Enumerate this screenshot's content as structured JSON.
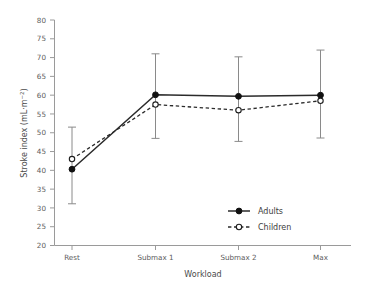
{
  "chart_data": {
    "type": "line",
    "title": "",
    "xlabel": "Workload",
    "ylabel": "Stroke index (mL·m⁻²)",
    "ylabel_parts": {
      "main": "Stroke index (mL·m",
      "superscript": "−2",
      "tail": ")"
    },
    "categories": [
      "Rest",
      "Submax 1",
      "Submax 2",
      "Max"
    ],
    "ylim": [
      20,
      80
    ],
    "yticks": [
      20,
      25,
      30,
      35,
      40,
      45,
      50,
      55,
      60,
      65,
      70,
      75,
      80
    ],
    "ytick_labels": [
      "20",
      "25",
      "30",
      "35",
      "40",
      "45",
      "50",
      "55",
      "60",
      "65",
      "70",
      "75",
      "80"
    ],
    "grid": false,
    "legend_position": "inside-lower-right",
    "series": [
      {
        "name": "Adults",
        "marker": "filled-circle",
        "linestyle": "solid",
        "values": [
          40.3,
          60.1,
          59.7,
          60.0
        ],
        "errors_low": [
          31.1,
          48.5,
          47.7,
          48.6
        ],
        "errors_high": [
          51.5,
          71.0,
          70.2,
          72.0
        ]
      },
      {
        "name": "Children",
        "marker": "open-circle",
        "linestyle": "dashed",
        "values": [
          43.0,
          57.5,
          56.0,
          58.5
        ],
        "errors_low": [
          null,
          null,
          null,
          null
        ],
        "errors_high": [
          null,
          null,
          null,
          null
        ]
      }
    ],
    "colors": {
      "line": "#2b2b2b",
      "error_bar": "#8a8a8a",
      "axis": "#9a9a9a",
      "text": "#4a4a4a",
      "background": "#ffffff"
    }
  },
  "legend": {
    "items": [
      {
        "label": "Adults",
        "marker": "filled-circle",
        "linestyle": "solid"
      },
      {
        "label": "Children",
        "marker": "open-circle",
        "linestyle": "dashed"
      }
    ]
  }
}
